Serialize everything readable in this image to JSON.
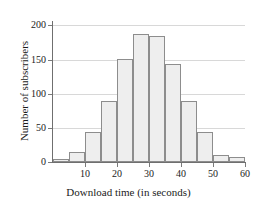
{
  "chart_data": {
    "type": "bar",
    "title": "",
    "xlabel": "Download time (in seconds)",
    "ylabel": "Number of subscribers",
    "categories": [
      "0-5",
      "5-10",
      "10-15",
      "15-20",
      "20-25",
      "25-30",
      "30-35",
      "35-40",
      "40-45",
      "45-50",
      "50-55",
      "55-60"
    ],
    "bin_starts": [
      0,
      5,
      10,
      15,
      20,
      25,
      30,
      35,
      40,
      45,
      50,
      55
    ],
    "bin_width": 5,
    "values": [
      5,
      14,
      44,
      89,
      151,
      188,
      185,
      144,
      89,
      44,
      10,
      7
    ],
    "xlim": [
      0,
      60
    ],
    "ylim": [
      0,
      205
    ],
    "xticks": [
      10,
      20,
      30,
      40,
      50,
      60
    ],
    "yticks": [
      0,
      50,
      100,
      150,
      200
    ],
    "xtick_labels": [
      "10",
      "20",
      "30",
      "40",
      "50",
      "60"
    ],
    "ytick_labels": [
      "0",
      "50",
      "100",
      "150",
      "200"
    ],
    "gridlines": [
      50,
      100,
      150,
      200
    ],
    "grid": true,
    "legend": null,
    "colors": {
      "bar_fill": "#eeeeee",
      "bar_edge": "#8d8d8d",
      "grid": "#d8d8d8",
      "axis": "#6f6f6f",
      "text": "#1b1b1b",
      "background": "#ffffff"
    }
  }
}
